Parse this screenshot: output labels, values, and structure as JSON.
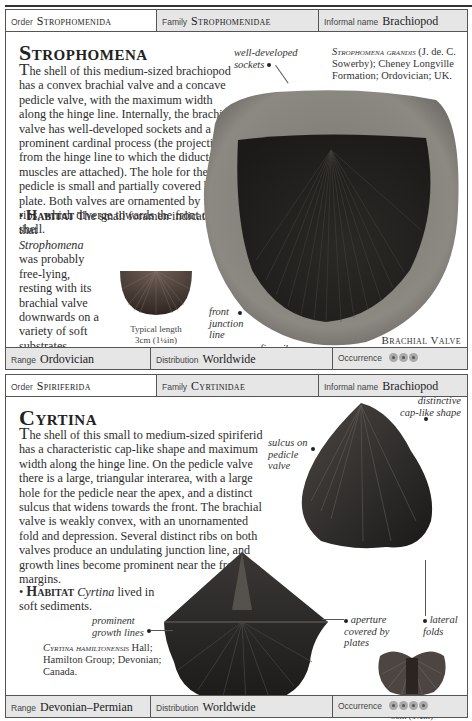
{
  "entries": [
    {
      "header": {
        "order_label": "Order",
        "order": "Strophomenida",
        "family_label": "Family",
        "family": "Strophomenidae",
        "informal_label": "Informal name",
        "informal": "Brachiopod"
      },
      "title": "Strophomena",
      "description_first_letter": "T",
      "description": "he shell of this medium-sized brachiopod has a convex brachial valve and a concave pedicle valve, with the maximum width along the hinge line. Internally, the brachial valve has well-developed sockets and a prominent cardinal process (the projection from the hinge line to which the diductor muscles are attached). The hole for the pedicle is small and partially covered by a plate. Both valves are ornamented by fine ribs, which diverge towards the front of the shell.",
      "habitat_bullet": "•",
      "habitat_label": "Habitat",
      "habitat_pre": "The small foramen indicates that ",
      "habitat_genus": "Strophomena",
      "habitat_post": " was probably free-lying, resting with its brachial valve downwards on a variety of soft substrates.",
      "species_name": "Strophomena grandis",
      "species_rest": " (J. de. C. Sowerby); Cheney Longville Formation; Ordovician; UK.",
      "annotations": {
        "sockets": "well-developed sockets",
        "front_junction": "front junction line",
        "fine_ribs": "fine ribs"
      },
      "view_label": "Brachial Valve Interior",
      "typical_length_label": "Typical length",
      "typical_length": "3cm (1¼in)",
      "footer": {
        "range_label": "Range",
        "range": "Ordovician",
        "distribution_label": "Distribution",
        "distribution": "Worldwide",
        "occurrence_label": "Occurrence",
        "occurrence_count": 3
      }
    },
    {
      "header": {
        "order_label": "Order",
        "order": "Spiriferida",
        "family_label": "Family",
        "family": "Cyrtinidae",
        "informal_label": "Informal name",
        "informal": "Brachiopod"
      },
      "title": "Cyrtina",
      "description_first_letter": "T",
      "description": "he shell of this small to medium-sized spiriferid has a characteristic cap-like shape and maximum width along the hinge line. On the pedicle valve there is a large, triangular interarea, with a large hole for the pedicle near the apex, and a distinct sulcus that widens towards the front. The brachial valve is weakly convex, with an unornamented fold and depression. Several distinct ribs on both valves produce an undulating junction line, and growth lines become prominent near the front margins.",
      "habitat_bullet": "•",
      "habitat_label": "Habitat",
      "habitat_pre": "",
      "habitat_genus": "Cyrtina",
      "habitat_post": " lived in soft sediments.",
      "species_name": "Cyrtina hamiltonensis",
      "species_rest": " Hall; Hamilton Group; Devonian; Canada.",
      "annotations": {
        "sulcus": "sulcus on pedicle valve",
        "cap_shape": "distinctive cap-like shape",
        "aperture": "aperture covered by plates",
        "lateral_folds": "lateral folds",
        "growth_lines": "prominent growth lines"
      },
      "typical_length_label": "Typical length",
      "typical_length": "5cm (1¾in)",
      "footer": {
        "range_label": "Range",
        "range": "Devonian–Permian",
        "distribution_label": "Distribution",
        "distribution": "Worldwide",
        "occurrence_label": "Occurrence",
        "occurrence_count": 4
      }
    }
  ]
}
